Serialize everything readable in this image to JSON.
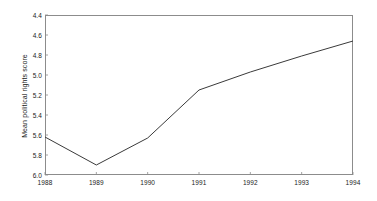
{
  "chart_data": {
    "type": "line",
    "title": "",
    "xlabel": "",
    "ylabel": "Mean political rights score",
    "x": [
      1988,
      1989,
      1990,
      1991,
      1992,
      1993,
      1994
    ],
    "categories": [
      "1988",
      "1989",
      "1990",
      "1991",
      "1992",
      "1993",
      "1994"
    ],
    "values": [
      5.62,
      5.9,
      5.63,
      5.15,
      4.97,
      4.81,
      4.66
    ],
    "series": [
      {
        "name": "Mean political rights score",
        "values": [
          5.62,
          5.9,
          5.63,
          5.15,
          4.97,
          4.81,
          4.66
        ]
      }
    ],
    "xlim": [
      1988,
      1994
    ],
    "ylim": [
      4.4,
      6.0
    ],
    "y_axis_inverted": true,
    "ytick_labels": [
      "4.4",
      "4.6",
      "4.8",
      "5.0",
      "5.2",
      "5.4",
      "5.6",
      "5.8",
      "6.0"
    ],
    "ytick_values": [
      4.4,
      4.6,
      4.8,
      5.0,
      5.2,
      5.4,
      5.6,
      5.8,
      6.0
    ],
    "xtick_labels": [
      "1988",
      "1989",
      "1990",
      "1991",
      "1992",
      "1993",
      "1994"
    ],
    "xtick_values": [
      1988,
      1989,
      1990,
      1991,
      1992,
      1993,
      1994
    ],
    "grid": false,
    "legend": false,
    "legend_position": "none",
    "line_color": "#3a3a3a",
    "axis_color": "#8c8c8c",
    "text_color": "#1a1a1a",
    "background_color": "#ffffff"
  }
}
